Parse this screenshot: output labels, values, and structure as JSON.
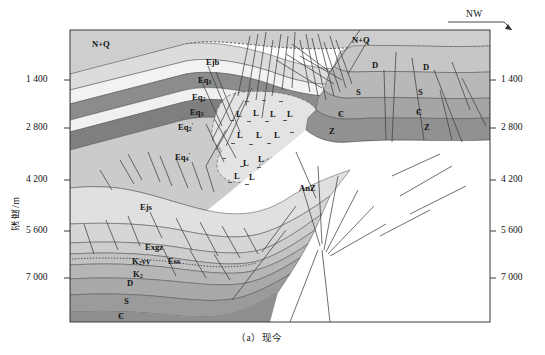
{
  "figure": {
    "caption": "（a）现今",
    "orientation_label": "NW",
    "axis": {
      "title": "深度/m",
      "ticks": [
        "1 400",
        "2 800",
        "4 200",
        "5 600",
        "7 000"
      ],
      "tick_values": [
        1400,
        2800,
        4200,
        5600,
        7000
      ],
      "right_ticks": [
        "1 400",
        "2 800",
        "4 200",
        "5 600",
        "7 000"
      ]
    },
    "units": [
      {
        "id": "nq-left",
        "label": "N+Q",
        "x": 92,
        "y": 40
      },
      {
        "id": "nq-right",
        "label": "N+Q",
        "x": 352,
        "y": 36
      },
      {
        "id": "ejb",
        "label": "Ejb",
        "x": 206,
        "y": 58
      },
      {
        "id": "eq1",
        "label": "Eq",
        "sub": "1",
        "x": 198,
        "y": 76
      },
      {
        "id": "eq2",
        "label": "Eq",
        "sub": "2",
        "x": 192,
        "y": 93
      },
      {
        "id": "eq3",
        "label": "Eq",
        "sub": "3",
        "x": 190,
        "y": 108
      },
      {
        "id": "eq2p",
        "label": "Eq",
        "sub": "2",
        "sup": "'",
        "x": 178,
        "y": 122
      },
      {
        "id": "eq4p",
        "label": "Eq",
        "sub": "4",
        "sup": "'",
        "x": 175,
        "y": 152
      },
      {
        "id": "ejs",
        "label": "Ejs",
        "x": 140,
        "y": 203
      },
      {
        "id": "exgz",
        "label": "Exgz",
        "x": 145,
        "y": 243
      },
      {
        "id": "k2yy",
        "label": "K",
        "sub": "2",
        "suffix": "yy",
        "x": 132,
        "y": 257
      },
      {
        "id": "ess",
        "label": "Ess",
        "x": 168,
        "y": 257
      },
      {
        "id": "k2",
        "label": "K",
        "sub": "2",
        "x": 133,
        "y": 270
      },
      {
        "id": "d-left",
        "label": "D",
        "x": 127,
        "y": 279
      },
      {
        "id": "s-left",
        "label": "S",
        "x": 124,
        "y": 297
      },
      {
        "id": "c-left",
        "label": "Є",
        "x": 118,
        "y": 312
      },
      {
        "id": "d-mid",
        "label": "D",
        "x": 372,
        "y": 61
      },
      {
        "id": "d-right",
        "label": "D",
        "x": 423,
        "y": 63
      },
      {
        "id": "s-mid",
        "label": "S",
        "x": 356,
        "y": 88
      },
      {
        "id": "s-right",
        "label": "S",
        "x": 418,
        "y": 88
      },
      {
        "id": "c-mid",
        "label": "Є",
        "x": 338,
        "y": 110
      },
      {
        "id": "c-right",
        "label": "Є",
        "x": 416,
        "y": 108
      },
      {
        "id": "z-mid",
        "label": "Z",
        "x": 329,
        "y": 127
      },
      {
        "id": "z-right",
        "label": "Z",
        "x": 424,
        "y": 123
      },
      {
        "id": "anz",
        "label": "AnZ",
        "x": 299,
        "y": 184
      },
      {
        "id": "salt-l-1",
        "label": "L",
        "x": 236,
        "y": 110
      },
      {
        "id": "salt-l-2",
        "label": "L",
        "x": 253,
        "y": 109
      },
      {
        "id": "salt-l-3",
        "label": "L",
        "x": 270,
        "y": 110
      },
      {
        "id": "salt-l-4",
        "label": "L",
        "x": 287,
        "y": 110
      },
      {
        "id": "salt-l-5",
        "label": "L",
        "x": 237,
        "y": 131
      },
      {
        "id": "salt-l-6",
        "label": "L",
        "x": 256,
        "y": 131
      },
      {
        "id": "salt-l-7",
        "label": "L",
        "x": 274,
        "y": 131
      },
      {
        "id": "salt-l-8",
        "label": "L",
        "x": 258,
        "y": 155
      },
      {
        "id": "salt-l-9",
        "label": "L",
        "x": 243,
        "y": 159
      },
      {
        "id": "salt-l-10",
        "label": "L",
        "x": 234,
        "y": 172
      },
      {
        "id": "salt-l-11",
        "label": "L",
        "x": 249,
        "y": 173
      }
    ],
    "colors": {
      "frame": "#3a3a3a",
      "light_gray": "#cfcfcf",
      "pale": "#efefef",
      "mid_gray": "#b4b4b4",
      "dark_gray": "#8f8f8f",
      "darker_gray": "#7d7d7d",
      "white": "#ffffff",
      "fault_line": "#4a4a4a",
      "text": "#111111"
    }
  }
}
